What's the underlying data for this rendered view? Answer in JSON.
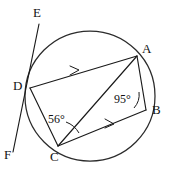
{
  "figure": {
    "type": "circle-geometry-diagram",
    "background_color": "#ffffff",
    "stroke_color": "#1a1a1a",
    "circle": {
      "cx": 90,
      "cy": 96,
      "r": 65
    },
    "points": [
      {
        "name": "A",
        "x": 137,
        "y": 56,
        "label": "A",
        "label_x": 142,
        "label_y": 42
      },
      {
        "name": "B",
        "x": 146,
        "y": 110,
        "label": "B",
        "label_x": 152,
        "label_y": 105
      },
      {
        "name": "C",
        "x": 58,
        "y": 146,
        "label": "C",
        "label_x": 50,
        "label_y": 152
      },
      {
        "name": "D",
        "x": 30,
        "y": 88,
        "label": "D",
        "label_x": 13,
        "label_y": 80
      },
      {
        "name": "E",
        "x": 39,
        "y": 24,
        "label": "E",
        "label_x": 33,
        "label_y": 8
      },
      {
        "name": "F",
        "x": 13,
        "y": 152,
        "label": "F",
        "label_x": 5,
        "label_y": 150
      }
    ],
    "segments": [
      {
        "name": "segment-DA",
        "from": "D",
        "to": "A",
        "parallel_mark": true
      },
      {
        "name": "segment-CB",
        "from": "C",
        "to": "B",
        "parallel_mark": true
      },
      {
        "name": "segment-DC",
        "from": "D",
        "to": "C",
        "parallel_mark": false
      },
      {
        "name": "segment-AB",
        "from": "A",
        "to": "B",
        "parallel_mark": false
      },
      {
        "name": "segment-CA",
        "from": "C",
        "to": "A",
        "parallel_mark": false
      },
      {
        "name": "line-EF",
        "from": "E",
        "to": "F",
        "parallel_mark": false
      }
    ],
    "angles": [
      {
        "name": "angle-at-C",
        "value": "56°",
        "vertex": "C",
        "label_x": 49,
        "label_y": 116
      },
      {
        "name": "angle-at-B",
        "value": "95°",
        "vertex": "B",
        "label_x": 116,
        "label_y": 96
      }
    ]
  }
}
